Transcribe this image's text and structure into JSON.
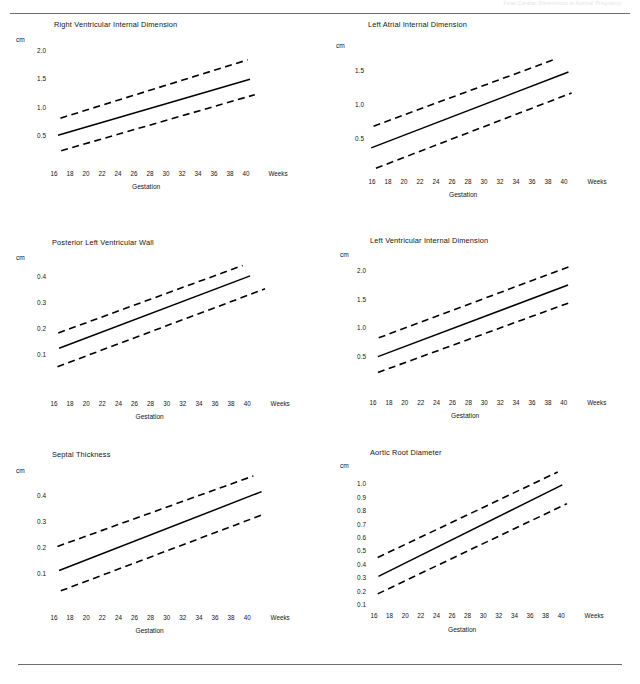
{
  "page": {
    "header_text": "Fetal Cardiac Dimensions in Normal Pregnancy",
    "x_axis_label": "Gestation",
    "unit_label": "cm",
    "weeks_label": "Weeks"
  },
  "chart_data": [
    {
      "id": "right-ventricular-internal-dimension",
      "type": "line",
      "title": "Right Ventricular Internal Dimension",
      "xlabel": "Gestation",
      "ylabel": "cm",
      "x": [
        16,
        18,
        20,
        22,
        24,
        26,
        28,
        30,
        32,
        34,
        36,
        38,
        40
      ],
      "xticklabels": [
        "16",
        "18",
        "20",
        "22",
        "24",
        "26",
        "28",
        "30",
        "32",
        "34",
        "36",
        "38",
        "40"
      ],
      "xlim": [
        15,
        41
      ],
      "ylim": [
        0.0,
        2.1
      ],
      "yticks": [
        0.5,
        1.0,
        1.5,
        2.0
      ],
      "yticklabels": [
        "0.5",
        "1.0",
        "1.5",
        "2.0"
      ],
      "grid": false,
      "legend": "none",
      "series": [
        {
          "name": "+2 SD",
          "style": "dashed",
          "x": [
            16.3,
            39.7
          ],
          "values": [
            0.82,
            1.84
          ]
        },
        {
          "name": "Mean",
          "style": "solid",
          "x": [
            16.0,
            40.0
          ],
          "values": [
            0.52,
            1.5
          ]
        },
        {
          "name": "-2 SD",
          "style": "dashed",
          "x": [
            16.4,
            40.6
          ],
          "values": [
            0.25,
            1.23
          ]
        }
      ]
    },
    {
      "id": "left-atrial-internal-dimension",
      "type": "line",
      "title": "Left Atrial Internal Dimension",
      "xlabel": "Gestation",
      "ylabel": "cm",
      "x": [
        16,
        18,
        20,
        22,
        24,
        26,
        28,
        30,
        32,
        34,
        36,
        38,
        40
      ],
      "xticklabels": [
        "16",
        "18",
        "20",
        "22",
        "24",
        "26",
        "28",
        "30",
        "32",
        "34",
        "36",
        "38",
        "40"
      ],
      "xlim": [
        15,
        41
      ],
      "ylim": [
        0.0,
        1.8
      ],
      "yticks": [
        0.5,
        1.0,
        1.5
      ],
      "yticklabels": [
        "0.5",
        "1.0",
        "1.5"
      ],
      "grid": false,
      "legend": "none",
      "series": [
        {
          "name": "+2 SD",
          "style": "dashed",
          "x": [
            15.7,
            38.6
          ],
          "values": [
            0.69,
            1.68
          ]
        },
        {
          "name": "Mean",
          "style": "solid",
          "x": [
            15.4,
            40.3
          ],
          "values": [
            0.37,
            1.49
          ]
        },
        {
          "name": "-2 SD",
          "style": "dashed",
          "x": [
            16.0,
            40.7
          ],
          "values": [
            0.07,
            1.18
          ]
        }
      ]
    },
    {
      "id": "posterior-left-ventricular-wall",
      "type": "line",
      "title": "Posterior Left Ventricular Wall",
      "xlabel": "Gestation",
      "ylabel": "cm",
      "x": [
        16,
        18,
        20,
        22,
        24,
        26,
        28,
        30,
        32,
        34,
        36,
        38,
        40
      ],
      "xticklabels": [
        "16",
        "18",
        "20",
        "22",
        "24",
        "26",
        "28",
        "30",
        "32",
        "34",
        "36",
        "38",
        "40"
      ],
      "xlim": [
        15,
        41
      ],
      "ylim": [
        0.0,
        0.47
      ],
      "yticks": [
        0.1,
        0.2,
        0.3,
        0.4
      ],
      "yticklabels": [
        "0.1",
        "0.2",
        "0.3",
        "0.4"
      ],
      "grid": false,
      "legend": "none",
      "series": [
        {
          "name": "+2 SD",
          "style": "dashed",
          "x": [
            16.0,
            38.3
          ],
          "values": [
            0.185,
            0.445
          ]
        },
        {
          "name": "Mean",
          "style": "solid",
          "x": [
            16.1,
            39.2
          ],
          "values": [
            0.126,
            0.405
          ]
        },
        {
          "name": "-2 SD",
          "style": "dashed",
          "x": [
            15.9,
            41.0
          ],
          "values": [
            0.055,
            0.355
          ]
        }
      ]
    },
    {
      "id": "left-ventricular-internal-dimension",
      "type": "line",
      "title": "Left Ventricular Internal Dimension",
      "xlabel": "Gestation",
      "ylabel": "cm",
      "x": [
        16,
        18,
        20,
        22,
        24,
        26,
        28,
        30,
        32,
        34,
        36,
        38,
        40
      ],
      "xticklabels": [
        "16",
        "18",
        "20",
        "22",
        "24",
        "26",
        "28",
        "30",
        "32",
        "34",
        "36",
        "38",
        "40"
      ],
      "xlim": [
        15,
        41
      ],
      "ylim": [
        0.0,
        2.2
      ],
      "yticks": [
        0.5,
        1.0,
        1.5,
        2.0
      ],
      "yticklabels": [
        "0.5",
        "1.0",
        "1.5",
        "2.0"
      ],
      "grid": false,
      "legend": "none",
      "series": [
        {
          "name": "+2 SD",
          "style": "dashed",
          "x": [
            16.1,
            40.1
          ],
          "values": [
            0.83,
            2.08
          ]
        },
        {
          "name": "Mean",
          "style": "solid",
          "x": [
            16.0,
            40.0
          ],
          "values": [
            0.5,
            1.76
          ]
        },
        {
          "name": "-2 SD",
          "style": "dashed",
          "x": [
            16.0,
            40.2
          ],
          "values": [
            0.22,
            1.45
          ]
        }
      ]
    },
    {
      "id": "septal-thickness",
      "type": "line",
      "title": "Septal Thickness",
      "xlabel": "Gestation",
      "ylabel": "cm",
      "x": [
        16,
        18,
        20,
        22,
        24,
        26,
        28,
        30,
        32,
        34,
        36,
        38,
        40
      ],
      "xticklabels": [
        "16",
        "18",
        "20",
        "22",
        "24",
        "26",
        "28",
        "30",
        "32",
        "34",
        "36",
        "38",
        "40"
      ],
      "xlim": [
        15,
        41
      ],
      "ylim": [
        0.0,
        0.49
      ],
      "yticks": [
        0.1,
        0.2,
        0.3,
        0.4
      ],
      "yticklabels": [
        "0.1",
        "0.2",
        "0.3",
        "0.4"
      ],
      "grid": false,
      "legend": "none",
      "series": [
        {
          "name": "+2 SD",
          "style": "dashed",
          "x": [
            15.9,
            39.6
          ],
          "values": [
            0.205,
            0.475
          ]
        },
        {
          "name": "Mean",
          "style": "solid",
          "x": [
            16.1,
            40.6
          ],
          "values": [
            0.113,
            0.415
          ]
        },
        {
          "name": "-2 SD",
          "style": "dashed",
          "x": [
            16.3,
            41.0
          ],
          "values": [
            0.035,
            0.33
          ]
        }
      ]
    },
    {
      "id": "aortic-root-diameter",
      "type": "line",
      "title": "Aortic Root Diameter",
      "xlabel": "Gestation",
      "ylabel": "cm",
      "x": [
        16,
        18,
        20,
        22,
        24,
        26,
        28,
        30,
        32,
        34,
        36,
        38,
        40
      ],
      "xticklabels": [
        "16",
        "18",
        "20",
        "22",
        "24",
        "26",
        "28",
        "30",
        "32",
        "34",
        "36",
        "38",
        "40"
      ],
      "xlim": [
        15,
        41
      ],
      "ylim": [
        0.08,
        1.12
      ],
      "yticks": [
        0.1,
        0.2,
        0.3,
        0.4,
        0.5,
        0.6,
        0.7,
        0.8,
        0.9,
        1.0
      ],
      "yticklabels": [
        "0.1",
        "0.2",
        "0.3",
        "0.4",
        "0.5",
        "0.6",
        "0.7",
        "0.8",
        "0.9",
        "1.0"
      ],
      "grid": false,
      "legend": "none",
      "series": [
        {
          "name": "+2 SD",
          "style": "dashed",
          "x": [
            16.0,
            39.4
          ],
          "values": [
            0.455,
            1.09
          ]
        },
        {
          "name": "Mean",
          "style": "solid",
          "x": [
            16.1,
            40.0
          ],
          "values": [
            0.315,
            0.995
          ]
        },
        {
          "name": "-2 SD",
          "style": "dashed",
          "x": [
            16.0,
            40.6
          ],
          "values": [
            0.185,
            0.855
          ]
        }
      ]
    }
  ]
}
